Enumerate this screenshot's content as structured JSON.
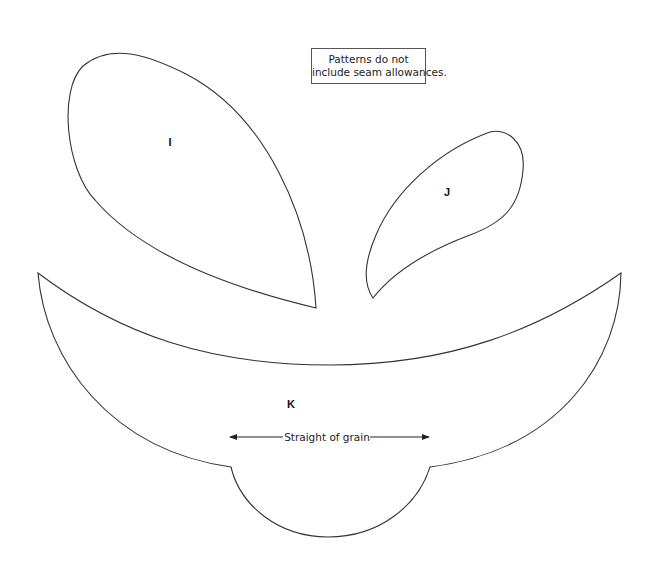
{
  "note": {
    "line1": "Patterns do not",
    "line2": "include seam allowances."
  },
  "pieces": {
    "i": {
      "label": "I"
    },
    "j": {
      "label": "J"
    },
    "k": {
      "label": "K"
    }
  },
  "grainline": {
    "label": "Straight of grain"
  },
  "colors": {
    "stroke": "#333333",
    "background": "#ffffff"
  }
}
